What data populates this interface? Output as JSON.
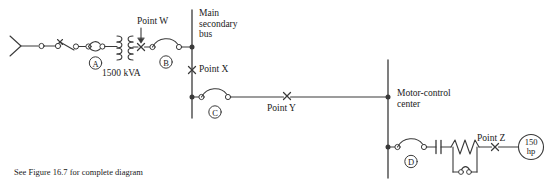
{
  "figure": {
    "caption": "See Figure 16.7 for complete diagram",
    "width": 555,
    "height": 187,
    "line_color": "#3a3a3a",
    "text_color": "#1a1a1a"
  },
  "labels": {
    "point_w": "Point W",
    "point_x": "Point X",
    "point_y": "Point Y",
    "point_z": "Point Z",
    "main_secondary_bus": "Main\nsecondary\nbus",
    "motor_control_center": "Motor-control\ncenter",
    "transformer_rating": "1500 kVA",
    "motor_rating": "150\nhp"
  },
  "devices": {
    "breaker_a": "A",
    "breaker_b": "B",
    "breaker_c": "C",
    "breaker_d": "D"
  },
  "fault_points": [
    {
      "id": "W",
      "label": "Point W",
      "x": 141,
      "y": 47,
      "marker": "x-cross",
      "has_arrow": true
    },
    {
      "id": "X",
      "label": "Point X",
      "x": 192,
      "y": 70,
      "marker": "x-cross",
      "has_arrow": false
    },
    {
      "id": "Y",
      "label": "Point Y",
      "x": 287,
      "y": 96,
      "marker": "x-cross",
      "has_arrow": false
    },
    {
      "id": "Z",
      "label": "Point Z",
      "x": 495,
      "y": 147,
      "marker": "x-cross",
      "has_arrow": false
    }
  ],
  "buses": [
    {
      "name": "main-secondary-bus",
      "x": 192,
      "y_top": 10,
      "y_bottom": 118
    },
    {
      "name": "motor-control-center-bus",
      "x": 388,
      "y_top": 60,
      "y_bottom": 178
    }
  ]
}
